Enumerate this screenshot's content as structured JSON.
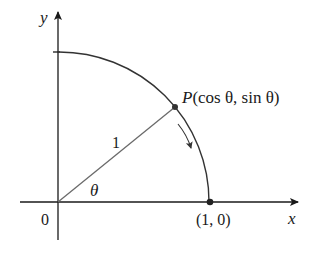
{
  "diagram": {
    "type": "unit-circle-quarter",
    "axes": {
      "x_label": "x",
      "y_label": "y",
      "origin_label": "0"
    },
    "radius_label": "1",
    "angle_label": "θ",
    "point_P": {
      "name": "P",
      "coords_label": "(cos θ, sin θ)"
    },
    "point_on_axis": {
      "coords_label": "(1, 0)"
    },
    "arrow_direction": "clockwise",
    "colors": {
      "axis": "#1a1a1a",
      "arc": "#333333",
      "radius_line": "#666666",
      "point": "#333333"
    }
  }
}
